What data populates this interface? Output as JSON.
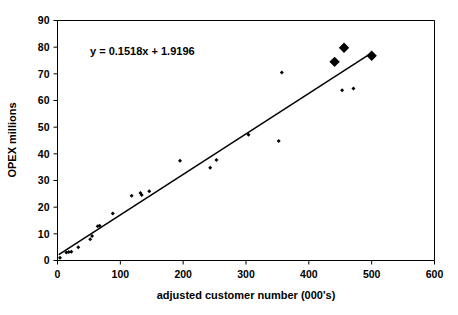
{
  "chart_data": {
    "type": "scatter",
    "title": "",
    "xlabel": "adjusted customer number (000's)",
    "ylabel": "OPEX millions",
    "xlim": [
      0,
      600
    ],
    "ylim": [
      0,
      90
    ],
    "xticks": [
      0,
      100,
      200,
      300,
      400,
      500,
      600
    ],
    "yticks": [
      0,
      10,
      20,
      30,
      40,
      50,
      60,
      70,
      80,
      90
    ],
    "grid": false,
    "legend": "none",
    "annotations": [
      {
        "text": "y = 0.1518x + 1.9196",
        "x": 135,
        "y": 77
      }
    ],
    "trendline": {
      "equation": "y = 0.1518x + 1.9196",
      "slope": 0.1518,
      "intercept": 1.9196,
      "x_start": 2,
      "x_end": 500
    },
    "series": [
      {
        "name": "OPEX vs adjusted customer number",
        "marker": "diamond",
        "marker_size": "small",
        "color": "#000000",
        "points": [
          {
            "x": 4,
            "y": 1.0
          },
          {
            "x": 14,
            "y": 3.0
          },
          {
            "x": 18,
            "y": 3.2
          },
          {
            "x": 22,
            "y": 3.3
          },
          {
            "x": 33,
            "y": 5.0
          },
          {
            "x": 52,
            "y": 8.0
          },
          {
            "x": 55,
            "y": 9.2
          },
          {
            "x": 64,
            "y": 12.8
          },
          {
            "x": 67,
            "y": 13.0
          },
          {
            "x": 88,
            "y": 17.6
          },
          {
            "x": 118,
            "y": 24.3
          },
          {
            "x": 132,
            "y": 25.3
          },
          {
            "x": 134,
            "y": 24.6
          },
          {
            "x": 146,
            "y": 26.0
          },
          {
            "x": 195,
            "y": 37.4
          },
          {
            "x": 243,
            "y": 34.8
          },
          {
            "x": 253,
            "y": 37.7
          },
          {
            "x": 304,
            "y": 47.2
          },
          {
            "x": 352,
            "y": 44.8
          },
          {
            "x": 357,
            "y": 70.5
          },
          {
            "x": 453,
            "y": 63.8
          },
          {
            "x": 471,
            "y": 64.5
          }
        ]
      },
      {
        "name": "Highlighted large markers",
        "marker": "diamond",
        "marker_size": "large",
        "color": "#000000",
        "points": [
          {
            "x": 441,
            "y": 74.5
          },
          {
            "x": 456,
            "y": 79.8
          },
          {
            "x": 500,
            "y": 76.8
          }
        ]
      }
    ]
  },
  "axes": {
    "x_title": "adjusted customer number (000's)",
    "y_title": "OPEX millions",
    "x_tick_labels": [
      "0",
      "100",
      "200",
      "300",
      "400",
      "500",
      "600"
    ],
    "y_tick_labels": [
      "0",
      "10",
      "20",
      "30",
      "40",
      "50",
      "60",
      "70",
      "80",
      "90"
    ]
  },
  "equation_text": "y = 0.1518x + 1.9196",
  "colors": {
    "marker": "#000000",
    "line": "#000000",
    "axis": "#000000",
    "background": "#ffffff"
  }
}
